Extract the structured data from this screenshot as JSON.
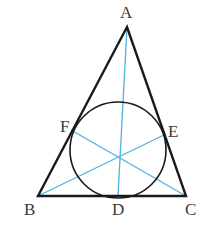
{
  "diagram": {
    "type": "triangle-incircle-cevians",
    "colors": {
      "triangle": "#1a1a1a",
      "circle": "#1a1a1a",
      "cevians": "#4fb3e0",
      "labels": "#3a3a3a"
    },
    "points": {
      "A": {
        "label": "A",
        "x": 127,
        "y": 27
      },
      "B": {
        "label": "B",
        "x": 38,
        "y": 196
      },
      "C": {
        "label": "C",
        "x": 186,
        "y": 196
      },
      "D": {
        "label": "D",
        "x": 118,
        "y": 196
      },
      "E": {
        "label": "E",
        "x": 166,
        "y": 134
      },
      "F": {
        "label": "F",
        "x": 71,
        "y": 130
      }
    },
    "incircle": {
      "cx": 118,
      "cy": 150,
      "r": 48
    },
    "cevians": [
      "AD",
      "BE",
      "CF"
    ]
  }
}
